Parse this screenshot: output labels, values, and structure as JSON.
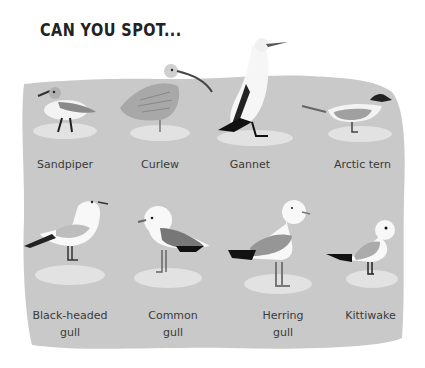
{
  "title": "CAN YOU SPOT...",
  "colors": {
    "background": "#ffffff",
    "panel": "#c9c9c9",
    "puddle": "#e2e2e2",
    "text": "#3a3a3a"
  },
  "birds": [
    {
      "name": "Sandpiper",
      "label": "Sandpiper"
    },
    {
      "name": "Curlew",
      "label": "Curlew"
    },
    {
      "name": "Gannet",
      "label": "Gannet"
    },
    {
      "name": "Arctic tern",
      "label": "Arctic tern"
    },
    {
      "name": "Black-headed gull",
      "label": "Black-headed\ngull"
    },
    {
      "name": "Common gull",
      "label": "Common\ngull"
    },
    {
      "name": "Herring gull",
      "label": "Herring\ngull"
    },
    {
      "name": "Kittiwake",
      "label": "Kittiwake"
    }
  ]
}
